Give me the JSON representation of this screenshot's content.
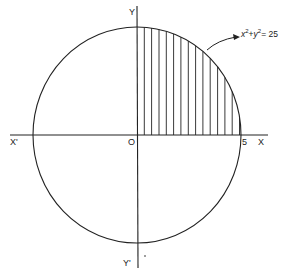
{
  "figure": {
    "type": "circle-area-diagram",
    "equation_label": "x²+y²=25",
    "equation_parts": {
      "x": "x",
      "x_exp": "2",
      "plus": "+",
      "y": "y",
      "y_exp": "2",
      "rhs": "= 25"
    },
    "axes": {
      "x_positive_label": "X",
      "x_negative_label": "X'",
      "y_positive_label": "Y",
      "y_negative_label": "Y'",
      "origin_label": "O",
      "x_intercept_label": "5"
    },
    "shaded_region": "first quadrant of the circle (vertical hatching)",
    "hatch_line_count": 14,
    "colors": {
      "line": "#222222",
      "background": "#ffffff"
    }
  }
}
